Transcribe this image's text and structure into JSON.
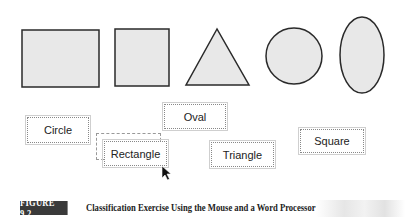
{
  "shapes": [
    {
      "name": "rectangle",
      "type": "rectangle"
    },
    {
      "name": "square",
      "type": "square"
    },
    {
      "name": "triangle",
      "type": "triangle"
    },
    {
      "name": "circle",
      "type": "circle"
    },
    {
      "name": "oval",
      "type": "oval"
    }
  ],
  "labels": {
    "circle": "Circle",
    "oval": "Oval",
    "rectangle": "Rectangle",
    "triangle": "Triangle",
    "square": "Square"
  },
  "caption": {
    "figure_number": "FIGURE 9.2",
    "title": "Classification Exercise Using the Mouse and a Word Processor"
  },
  "colors": {
    "shape_fill": "#e8e8e8",
    "shape_stroke": "#2a2a2a",
    "figure_badge": "#3a3a3a"
  }
}
